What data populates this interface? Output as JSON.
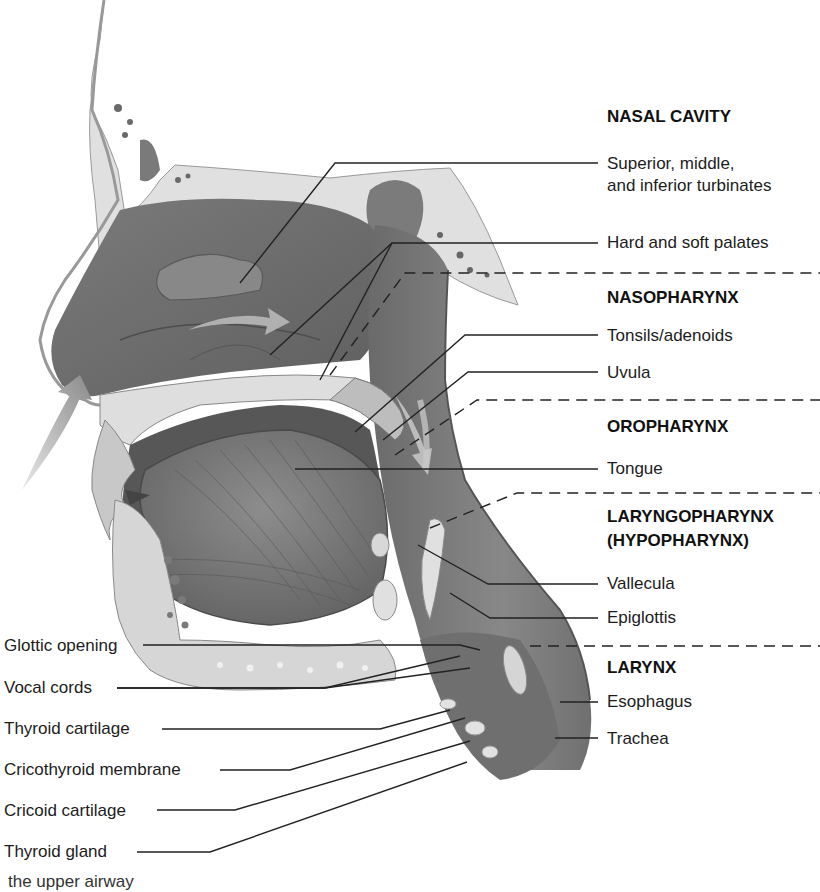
{
  "figure": {
    "caption_fragment": "the upper airway",
    "colors": {
      "tissue_dark": "#6e6e6e",
      "tissue_mid": "#8c8c8c",
      "bone": "#dcdcdc",
      "leader_line": "#222222",
      "background": "#ffffff"
    }
  },
  "right_labels": {
    "sections": [
      {
        "id": "nasal-cavity",
        "title": "NASAL CAVITY",
        "items": [
          "Superior, middle,",
          "and inferior turbinates",
          "Hard and soft palates"
        ]
      },
      {
        "id": "nasopharynx",
        "title": "NASOPHARYNX",
        "items": [
          "Tonsils/adenoids",
          "Uvula"
        ]
      },
      {
        "id": "oropharynx",
        "title": "OROPHARYNX",
        "items": [
          "Tongue"
        ]
      },
      {
        "id": "laryngopharynx",
        "title": "LARYNGOPHARYNX",
        "subtitle": "(HYPOPHARYNX)",
        "items": [
          "Vallecula",
          "Epiglottis"
        ]
      },
      {
        "id": "larynx",
        "title": "LARYNX",
        "items": [
          "Esophagus",
          "Trachea"
        ]
      }
    ]
  },
  "left_labels": {
    "items": [
      "Glottic opening",
      "Vocal cords",
      "Thyroid cartilage",
      "Cricothyroid membrane",
      "Cricoid cartilage",
      "Thyroid gland"
    ]
  }
}
